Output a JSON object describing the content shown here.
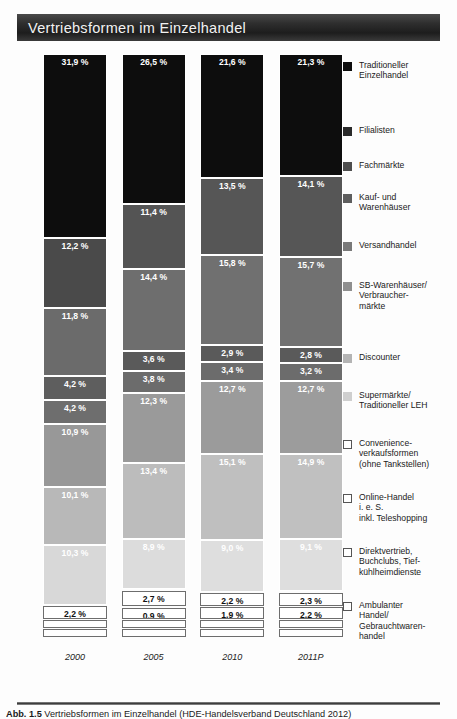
{
  "title": "Vertriebsformen im Einzelhandel",
  "caption_prefix": "Abb. 1.5",
  "caption_text": "Vertriebsformen im Einzelhandel (HDE-Handelsverband Deutschland 2012)",
  "colors": {
    "traditioneller_einzelhandel": "#0d0d0d",
    "filialisten": "#2a2a2a",
    "fachmaerkte": "#4e4e4e",
    "kauf_und_warenhaeuser": "#5e5e5e",
    "versandhandel": "#797979",
    "sb_warenhaeuser": "#8f8f8f",
    "discounter": "#b4b4b4",
    "supermaerkte": "#cfcfcf",
    "convenience": "#ffffff",
    "online_handel": "#ffffff",
    "direktvertrieb": "#ffffff",
    "ambulanter_handel": "#ffffff",
    "outline_stroke": "#6d6d6d",
    "title_text": "#f2f2f2"
  },
  "legend": {
    "items": [
      {
        "label": "Traditioneller\nEinzelhandel",
        "swatch": "filled",
        "color": "#0d0d0d",
        "name": "legend-traditioneller-einzelhandel"
      },
      {
        "label": "Filialisten",
        "swatch": "filled",
        "color": "#2a2a2a",
        "name": "legend-filialisten"
      },
      {
        "label": "Fachmärkte",
        "swatch": "filled",
        "color": "#4e4e4e",
        "name": "legend-fachmaerkte"
      },
      {
        "label": "Kauf- und\nWarenhäuser",
        "swatch": "filled",
        "color": "#5e5e5e",
        "name": "legend-kauf-und-warenhaeuser"
      },
      {
        "label": "Versandhandel",
        "swatch": "filled",
        "color": "#797979",
        "name": "legend-versandhandel"
      },
      {
        "label": "SB-Warenhäuser/\nVerbraucher-\nmärkte",
        "swatch": "filled",
        "color": "#8f8f8f",
        "name": "legend-sb-warenhaeuser"
      },
      {
        "label": "Discounter",
        "swatch": "filled",
        "color": "#b4b4b4",
        "name": "legend-discounter"
      },
      {
        "label": "Supermärkte/\nTraditioneller LEH",
        "swatch": "filled",
        "color": "#cfcfcf",
        "name": "legend-supermaerkte"
      },
      {
        "label": "Convenience-\nverkaufsformen\n(ohne Tankstellen)",
        "swatch": "open",
        "color": "#ffffff",
        "name": "legend-convenience"
      },
      {
        "label": "Online-Handel\ni. e. S.\ninkl. Teleshopping",
        "swatch": "open",
        "color": "#ffffff",
        "name": "legend-online-handel"
      },
      {
        "label": "Direktvertrieb,\nBuchclubs, Tief-\nkühlheimdienste",
        "swatch": "open",
        "color": "#ffffff",
        "name": "legend-direktvertrieb"
      },
      {
        "label": "Ambulanter\nHandel/\nGebrauchtwaren-\nhandel",
        "swatch": "open",
        "color": "#ffffff",
        "name": "legend-ambulanter-handel"
      }
    ]
  },
  "chart_data": {
    "type": "bar",
    "subtype": "stacked-100",
    "title": "Vertriebsformen im Einzelhandel",
    "xlabel": "",
    "ylabel": "",
    "unit": "%",
    "ylim": [
      0,
      100
    ],
    "grid": false,
    "legend_position": "right",
    "categories": [
      "2000",
      "2005",
      "2010",
      "2011P"
    ],
    "series": [
      {
        "name": "Traditioneller Einzelhandel",
        "color": "#0d0d0d",
        "values": [
          31.9,
          26.5,
          21.6,
          21.3
        ],
        "labels": [
          "31,9 %",
          "26,5 %",
          "21,6 %",
          "21,3 %"
        ]
      },
      {
        "name": "Filialisten",
        "color": "#2a2a2a",
        "values": [
          12.2,
          11.4,
          13.5,
          14.1
        ],
        "labels": [
          "12,2 %",
          "11,4 %",
          "13,5 %",
          "14,1 %"
        ]
      },
      {
        "name": "Fachmärkte",
        "color": "#4e4e4e",
        "values": [
          11.8,
          14.4,
          15.8,
          15.7
        ],
        "labels": [
          "11,8 %",
          "14,4 %",
          "15,8 %",
          "15,7 %"
        ]
      },
      {
        "name": "Kauf- und Warenhäuser",
        "color": "#5e5e5e",
        "values": [
          4.2,
          3.6,
          2.9,
          2.8
        ],
        "labels": [
          "4,2 %",
          "3,6 %",
          "2,9 %",
          "2,8 %"
        ]
      },
      {
        "name": "Versandhandel",
        "color": "#797979",
        "values": [
          4.2,
          3.8,
          3.4,
          3.2
        ],
        "labels": [
          "4,2 %",
          "3,8 %",
          "3,4 %",
          "3,2 %"
        ]
      },
      {
        "name": "SB-Warenhäuser/Verbrauchermärkte",
        "color": "#8f8f8f",
        "values": [
          10.9,
          12.3,
          12.7,
          12.7
        ],
        "labels": [
          "10,9 %",
          "12,3 %",
          "12,7 %",
          "12,7 %"
        ]
      },
      {
        "name": "Discounter",
        "color": "#b4b4b4",
        "values": [
          10.1,
          13.4,
          15.1,
          14.9
        ],
        "labels": [
          "10,1 %",
          "13,4 %",
          "15,1 %",
          "14,9 %"
        ]
      },
      {
        "name": "Supermärkte/Traditioneller LEH",
        "color": "#cfcfcf",
        "values": [
          10.3,
          8.9,
          9.0,
          9.1
        ],
        "labels": [
          "10,3 %",
          "8,9 %",
          "9,0 %",
          "9,1 %"
        ]
      },
      {
        "name": "Convenience-verkaufsformen (ohne Tankstellen)",
        "color": "#ffffff",
        "values": [
          2.2,
          2.7,
          2.2,
          2.3
        ],
        "labels": [
          "2,2 %",
          "2,7 %",
          "2,2 %",
          "2,3 %"
        ]
      },
      {
        "name": "Online-Handel i. e. S. inkl. Teleshopping",
        "color": "#ffffff",
        "values": [
          0.4,
          0.9,
          1.9,
          2.2
        ],
        "labels": [
          "",
          "0,9 %",
          "1,9 %",
          "2,2 %"
        ]
      },
      {
        "name": "Direktvertrieb, Buchclubs, Tiefkühlheimdienste",
        "color": "#ffffff",
        "values": [
          1.0,
          1.0,
          1.0,
          1.0
        ],
        "labels": [
          "",
          "",
          "",
          ""
        ]
      },
      {
        "name": "Ambulanter Handel/Gebrauchtwarenhandel",
        "color": "#ffffff",
        "values": [
          0.8,
          1.1,
          0.9,
          0.7
        ],
        "labels": [
          "",
          "",
          "",
          ""
        ]
      }
    ]
  },
  "columns": [
    {
      "name": "column-2000",
      "xlabel": "2000",
      "segments": [
        {
          "label": "31,9 %",
          "value": 31.9,
          "color": "#0d0d0d",
          "text": "#ffffff",
          "style": "fill",
          "name": "segment-traditioneller-einzelhandel"
        },
        {
          "label": "12,2 %",
          "value": 12.2,
          "color": "#4a4a4a",
          "text": "#ffffff",
          "style": "fill",
          "name": "segment-filialisten"
        },
        {
          "label": "11,8 %",
          "value": 11.8,
          "color": "#6b6b6b",
          "text": "#ffffff",
          "style": "fill",
          "name": "segment-fachmaerkte"
        },
        {
          "label": "4,2 %",
          "value": 4.2,
          "color": "#5e5e5e",
          "text": "#ffffff",
          "style": "fill",
          "name": "segment-kauf-und-warenhaeuser"
        },
        {
          "label": "4,2 %",
          "value": 4.2,
          "color": "#6e6e6e",
          "text": "#ffffff",
          "style": "fill",
          "name": "segment-versandhandel"
        },
        {
          "label": "10,9 %",
          "value": 10.9,
          "color": "#989898",
          "text": "#ffffff",
          "style": "fill",
          "name": "segment-sb-warenhaeuser"
        },
        {
          "label": "10,1 %",
          "value": 10.1,
          "color": "#b8b8b8",
          "text": "#ffffff",
          "style": "fill",
          "name": "segment-discounter"
        },
        {
          "label": "10,3 %",
          "value": 10.3,
          "color": "#d8d8d8",
          "text": "#ffffff",
          "style": "fill",
          "name": "segment-supermaerkte"
        },
        {
          "label": "2,2 %",
          "value": 2.2,
          "color": "#ffffff",
          "text": "#111111",
          "style": "outline",
          "name": "segment-convenience"
        },
        {
          "label": "",
          "value": 1.3,
          "color": "#ffffff",
          "text": "#111111",
          "style": "outline",
          "name": "segment-online-handel"
        },
        {
          "label": "",
          "value": 1.3,
          "color": "#ffffff",
          "text": "#111111",
          "style": "outline",
          "name": "segment-direktvertrieb"
        }
      ]
    },
    {
      "name": "column-2005",
      "xlabel": "2005",
      "segments": [
        {
          "label": "26,5 %",
          "value": 26.5,
          "color": "#0d0d0d",
          "text": "#ffffff",
          "style": "fill",
          "name": "segment-traditioneller-einzelhandel"
        },
        {
          "label": "11,4 %",
          "value": 11.4,
          "color": "#545454",
          "text": "#ffffff",
          "style": "fill",
          "name": "segment-filialisten"
        },
        {
          "label": "14,4 %",
          "value": 14.4,
          "color": "#6e6e6e",
          "text": "#ffffff",
          "style": "fill",
          "name": "segment-fachmaerkte"
        },
        {
          "label": "3,6 %",
          "value": 3.6,
          "color": "#5a5a5a",
          "text": "#ffffff",
          "style": "fill",
          "name": "segment-kauf-und-warenhaeuser"
        },
        {
          "label": "3,8 %",
          "value": 3.8,
          "color": "#6c6c6c",
          "text": "#ffffff",
          "style": "fill",
          "name": "segment-versandhandel"
        },
        {
          "label": "12,3 %",
          "value": 12.3,
          "color": "#9a9a9a",
          "text": "#ffffff",
          "style": "fill",
          "name": "segment-sb-warenhaeuser"
        },
        {
          "label": "13,4 %",
          "value": 13.4,
          "color": "#bcbcbc",
          "text": "#ffffff",
          "style": "fill",
          "name": "segment-discounter"
        },
        {
          "label": "8,9 %",
          "value": 8.9,
          "color": "#dcdcdc",
          "text": "#ffffff",
          "style": "fill",
          "name": "segment-supermaerkte"
        },
        {
          "label": "2,7 %",
          "value": 2.7,
          "color": "#ffffff",
          "text": "#111111",
          "style": "outline",
          "name": "segment-convenience"
        },
        {
          "label": "0,9 %",
          "value": 2.0,
          "color": "#ffffff",
          "text": "#111111",
          "style": "outline",
          "name": "segment-online-handel"
        },
        {
          "label": "",
          "value": 1.3,
          "color": "#ffffff",
          "text": "#111111",
          "style": "outline",
          "name": "segment-direktvertrieb"
        },
        {
          "label": "",
          "value": 1.3,
          "color": "#ffffff",
          "text": "#111111",
          "style": "outline",
          "name": "segment-ambulanter-handel"
        }
      ]
    },
    {
      "name": "column-2010",
      "xlabel": "2010",
      "segments": [
        {
          "label": "21,6 %",
          "value": 21.6,
          "color": "#0d0d0d",
          "text": "#ffffff",
          "style": "fill",
          "name": "segment-traditioneller-einzelhandel"
        },
        {
          "label": "13,5 %",
          "value": 13.5,
          "color": "#565656",
          "text": "#ffffff",
          "style": "fill",
          "name": "segment-filialisten"
        },
        {
          "label": "15,8 %",
          "value": 15.8,
          "color": "#707070",
          "text": "#ffffff",
          "style": "fill",
          "name": "segment-fachmaerkte"
        },
        {
          "label": "2,9 %",
          "value": 2.9,
          "color": "#5a5a5a",
          "text": "#ffffff",
          "style": "fill",
          "name": "segment-kauf-und-warenhaeuser"
        },
        {
          "label": "3,4 %",
          "value": 3.4,
          "color": "#6c6c6c",
          "text": "#ffffff",
          "style": "fill",
          "name": "segment-versandhandel"
        },
        {
          "label": "12,7 %",
          "value": 12.7,
          "color": "#9b9b9b",
          "text": "#ffffff",
          "style": "fill",
          "name": "segment-sb-warenhaeuser"
        },
        {
          "label": "15,1 %",
          "value": 15.1,
          "color": "#bfbfbf",
          "text": "#ffffff",
          "style": "fill",
          "name": "segment-discounter"
        },
        {
          "label": "9,0 %",
          "value": 9.0,
          "color": "#dedede",
          "text": "#ffffff",
          "style": "fill",
          "name": "segment-supermaerkte"
        },
        {
          "label": "2,2 %",
          "value": 2.2,
          "color": "#ffffff",
          "text": "#111111",
          "style": "outline",
          "name": "segment-convenience"
        },
        {
          "label": "1,9 %",
          "value": 2.0,
          "color": "#ffffff",
          "text": "#111111",
          "style": "outline",
          "name": "segment-online-handel"
        },
        {
          "label": "",
          "value": 1.3,
          "color": "#ffffff",
          "text": "#111111",
          "style": "outline",
          "name": "segment-direktvertrieb"
        },
        {
          "label": "",
          "value": 1.3,
          "color": "#ffffff",
          "text": "#111111",
          "style": "outline",
          "name": "segment-ambulanter-handel"
        }
      ]
    },
    {
      "name": "column-2011P",
      "xlabel": "2011P",
      "segments": [
        {
          "label": "21,3 %",
          "value": 21.3,
          "color": "#0d0d0d",
          "text": "#ffffff",
          "style": "fill",
          "name": "segment-traditioneller-einzelhandel"
        },
        {
          "label": "14,1 %",
          "value": 14.1,
          "color": "#565656",
          "text": "#ffffff",
          "style": "fill",
          "name": "segment-filialisten"
        },
        {
          "label": "15,7 %",
          "value": 15.7,
          "color": "#717171",
          "text": "#ffffff",
          "style": "fill",
          "name": "segment-fachmaerkte"
        },
        {
          "label": "2,8 %",
          "value": 2.8,
          "color": "#5a5a5a",
          "text": "#ffffff",
          "style": "fill",
          "name": "segment-kauf-und-warenhaeuser"
        },
        {
          "label": "3,2 %",
          "value": 3.2,
          "color": "#6c6c6c",
          "text": "#ffffff",
          "style": "fill",
          "name": "segment-versandhandel"
        },
        {
          "label": "12,7 %",
          "value": 12.7,
          "color": "#9c9c9c",
          "text": "#ffffff",
          "style": "fill",
          "name": "segment-sb-warenhaeuser"
        },
        {
          "label": "14,9 %",
          "value": 14.9,
          "color": "#c0c0c0",
          "text": "#ffffff",
          "style": "fill",
          "name": "segment-discounter"
        },
        {
          "label": "9,1 %",
          "value": 9.1,
          "color": "#dedede",
          "text": "#ffffff",
          "style": "fill",
          "name": "segment-supermaerkte"
        },
        {
          "label": "2,3 %",
          "value": 2.3,
          "color": "#ffffff",
          "text": "#111111",
          "style": "outline",
          "name": "segment-convenience"
        },
        {
          "label": "2,2 %",
          "value": 2.0,
          "color": "#ffffff",
          "text": "#111111",
          "style": "outline",
          "name": "segment-online-handel"
        },
        {
          "label": "",
          "value": 1.3,
          "color": "#ffffff",
          "text": "#111111",
          "style": "outline",
          "name": "segment-direktvertrieb"
        },
        {
          "label": "",
          "value": 1.3,
          "color": "#ffffff",
          "text": "#111111",
          "style": "outline",
          "name": "segment-ambulanter-handel"
        }
      ]
    }
  ]
}
